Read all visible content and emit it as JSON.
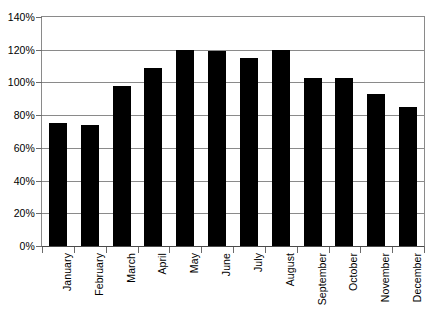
{
  "chart_data": {
    "type": "bar",
    "title": "",
    "xlabel": "",
    "ylabel": "",
    "categories": [
      "January",
      "February",
      "March",
      "April",
      "May",
      "June",
      "July",
      "August",
      "September",
      "October",
      "November",
      "December"
    ],
    "values": [
      75,
      74,
      98,
      109,
      120,
      119,
      115,
      120,
      103,
      103,
      93,
      85
    ],
    "value_suffix": "%",
    "ylim": [
      0,
      140
    ],
    "ytick_step": 20,
    "ytick_labels": [
      "0%",
      "20%",
      "40%",
      "60%",
      "80%",
      "100%",
      "120%",
      "140%"
    ],
    "ytick_values": [
      0,
      20,
      40,
      60,
      80,
      100,
      120,
      140
    ],
    "grid": true,
    "grid_axis": "y",
    "legend": false,
    "legend_position": "none",
    "bar_color": "#000000",
    "grid_color": "#8a8a8a",
    "axis_color": "#4a4a4a",
    "background_color": "#ffffff",
    "xtick_label_rotation": -90
  }
}
